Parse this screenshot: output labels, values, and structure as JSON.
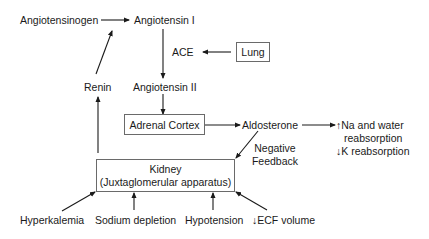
{
  "diagram": {
    "nodes": {
      "angiotensinogen": "Angiotensinogen",
      "angiotensin_1": "Angiotensin I",
      "ace": "ACE",
      "lung": "Lung",
      "renin": "Renin",
      "angiotensin_2": "Angiotensin II",
      "adrenal_cortex": "Adrenal Cortex",
      "aldosterone": "Aldosterone",
      "effect_na_line1": "Na and water",
      "effect_na_line2": "reabsorption",
      "effect_k": "K reabsorption",
      "negative_feedback_line1": "Negative",
      "negative_feedback_line2": "Feedback",
      "kidney_line1": "Kidney",
      "kidney_line2": "(Juxtaglomerular apparatus)",
      "hyperkalemia": "Hyperkalemia",
      "sodium_depletion": "Sodium depletion",
      "hypotension": "Hypotension",
      "ecf_volume": "ECF volume"
    },
    "symbols": {
      "up_arrow": "↑",
      "down_arrow": "↓"
    },
    "edges": [
      {
        "from": "Angiotensinogen",
        "to": "Angiotensin I"
      },
      {
        "from": "Angiotensin I",
        "to": "Angiotensin II",
        "label": "ACE"
      },
      {
        "from": "Lung",
        "to": "ACE"
      },
      {
        "from": "Renin",
        "to": "Angiotensin I"
      },
      {
        "from": "Angiotensin II",
        "to": "Adrenal Cortex"
      },
      {
        "from": "Adrenal Cortex",
        "to": "Aldosterone"
      },
      {
        "from": "Aldosterone",
        "to": "Na and water reabsorption / K reabsorption"
      },
      {
        "from": "Aldosterone",
        "to": "Kidney",
        "label": "Negative Feedback"
      },
      {
        "from": "Kidney",
        "to": "Renin"
      },
      {
        "from": "Hyperkalemia",
        "to": "Kidney"
      },
      {
        "from": "Sodium depletion",
        "to": "Kidney"
      },
      {
        "from": "Hypotension",
        "to": "Kidney"
      },
      {
        "from": "ECF volume",
        "to": "Kidney"
      }
    ],
    "colors": {
      "line": "#1a1a1a",
      "box_border": "#6a6a6a",
      "background": "#ffffff"
    }
  }
}
